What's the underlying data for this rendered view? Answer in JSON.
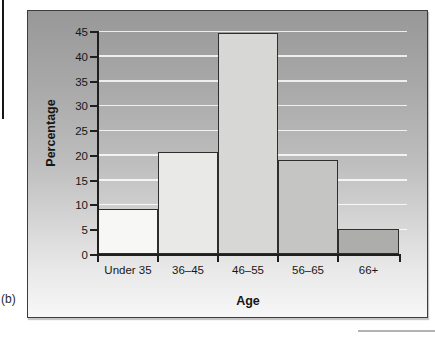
{
  "figure": {
    "panel_label": "(b)",
    "colors": {
      "bar_fills": [
        "#f7f7f5",
        "#e9e9e7",
        "#d7d7d5",
        "#c5c5c3",
        "#adadab"
      ],
      "bar_border": "#2e2e2e",
      "axis": "#1f1f1f",
      "gridline": "#ffffff",
      "background_top": "#989898",
      "background_bottom": "#f7f7f7"
    }
  },
  "chart_data": {
    "type": "bar",
    "title": "",
    "xlabel": "Age",
    "ylabel": "Percentage",
    "categories": [
      "Under 35",
      "36–45",
      "46–55",
      "56–65",
      "66+"
    ],
    "values": [
      9,
      20.5,
      44.5,
      19,
      5
    ],
    "ylim": [
      0,
      45
    ],
    "yticks": [
      0,
      5,
      10,
      15,
      20,
      25,
      30,
      35,
      40,
      45
    ],
    "grid": "horizontal-white-gridlines",
    "legend": "none",
    "bar_style": "adjacent-histogram-bars, fills shade darker with increasing age"
  }
}
